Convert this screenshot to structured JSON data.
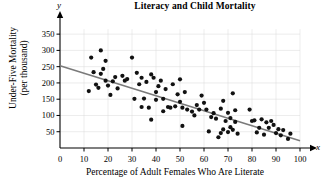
{
  "chart_data": {
    "type": "scatter",
    "title": "Literacy and Child Mortality",
    "xlabel": "Percentage of Adult Females Who Are Literate",
    "ylabel_line1": "Under-Five Mortality",
    "ylabel_line2": "(per thousand)",
    "x_axis_variable": "x",
    "y_axis_variable": "y",
    "xlim": [
      0,
      100
    ],
    "ylim": [
      0,
      375
    ],
    "xticks": [
      0,
      10,
      20,
      30,
      40,
      50,
      60,
      70,
      80,
      90,
      100
    ],
    "yticks": [
      50,
      100,
      150,
      200,
      250,
      300,
      350
    ],
    "grid": true,
    "grid_color": "#d9d9d9",
    "point_color": "#111111",
    "line_color": "#7a7a7a",
    "trendline": {
      "label": "least-squares regression line",
      "x_start": 0,
      "y_start": 253,
      "x_end": 100,
      "y_end": 22
    },
    "points": [
      [
        12,
        175
      ],
      [
        13,
        278
      ],
      [
        14,
        233
      ],
      [
        15,
        195
      ],
      [
        16,
        185
      ],
      [
        17,
        300
      ],
      [
        17,
        228
      ],
      [
        18,
        243
      ],
      [
        19,
        268
      ],
      [
        19,
        207
      ],
      [
        20,
        192
      ],
      [
        21,
        163
      ],
      [
        22,
        205
      ],
      [
        23,
        218
      ],
      [
        24,
        183
      ],
      [
        26,
        222
      ],
      [
        27,
        207
      ],
      [
        28,
        212
      ],
      [
        30,
        278
      ],
      [
        31,
        151
      ],
      [
        32,
        231
      ],
      [
        33,
        196
      ],
      [
        34,
        216
      ],
      [
        34,
        126
      ],
      [
        35,
        152
      ],
      [
        36,
        203
      ],
      [
        37,
        124
      ],
      [
        38,
        87
      ],
      [
        38,
        226
      ],
      [
        39,
        216
      ],
      [
        40,
        172
      ],
      [
        40,
        148
      ],
      [
        41,
        190
      ],
      [
        42,
        207
      ],
      [
        43,
        151
      ],
      [
        43,
        113
      ],
      [
        44,
        181
      ],
      [
        45,
        126
      ],
      [
        46,
        124
      ],
      [
        47,
        196
      ],
      [
        48,
        128
      ],
      [
        49,
        165
      ],
      [
        50,
        211
      ],
      [
        50,
        142
      ],
      [
        51,
        124
      ],
      [
        51,
        68
      ],
      [
        52,
        172
      ],
      [
        53,
        118
      ],
      [
        55,
        112
      ],
      [
        56,
        100
      ],
      [
        57,
        132
      ],
      [
        58,
        118
      ],
      [
        59,
        161
      ],
      [
        60,
        139
      ],
      [
        61,
        118
      ],
      [
        62,
        51
      ],
      [
        63,
        95
      ],
      [
        64,
        107
      ],
      [
        65,
        90
      ],
      [
        66,
        33
      ],
      [
        67,
        121
      ],
      [
        67,
        46
      ],
      [
        68,
        145
      ],
      [
        68,
        57
      ],
      [
        69,
        83
      ],
      [
        70,
        108
      ],
      [
        70,
        49
      ],
      [
        71,
        92
      ],
      [
        71,
        64
      ],
      [
        72,
        168
      ],
      [
        72,
        56
      ],
      [
        73,
        116
      ],
      [
        73,
        80
      ],
      [
        74,
        44
      ],
      [
        79,
        118
      ],
      [
        80,
        83
      ],
      [
        81,
        85
      ],
      [
        82,
        48
      ],
      [
        83,
        62
      ],
      [
        84,
        88
      ],
      [
        85,
        41
      ],
      [
        86,
        79
      ],
      [
        87,
        62
      ],
      [
        88,
        83
      ],
      [
        89,
        71
      ],
      [
        90,
        46
      ],
      [
        91,
        58
      ],
      [
        92,
        39
      ],
      [
        93,
        55
      ],
      [
        95,
        28
      ],
      [
        96,
        44
      ]
    ]
  }
}
